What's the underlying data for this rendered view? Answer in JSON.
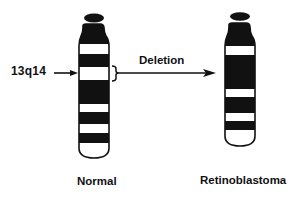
{
  "diagram": {
    "locus_label": "13q14",
    "transition_label": "Deletion",
    "left_chromosome": {
      "caption": "Normal",
      "bands": [
        {
          "type": "satellite",
          "y0": 14,
          "y1": 22
        },
        {
          "type": "dark",
          "y0": 26,
          "y1": 44
        },
        {
          "type": "light",
          "y0": 44,
          "y1": 54
        },
        {
          "type": "dark",
          "y0": 54,
          "y1": 67
        },
        {
          "type": "light",
          "y0": 67,
          "y1": 80
        },
        {
          "type": "dark",
          "y0": 80,
          "y1": 104
        },
        {
          "type": "light",
          "y0": 104,
          "y1": 112
        },
        {
          "type": "dark",
          "y0": 112,
          "y1": 124
        },
        {
          "type": "light",
          "y0": 124,
          "y1": 133
        },
        {
          "type": "dark",
          "y0": 133,
          "y1": 143
        },
        {
          "type": "light",
          "y0": 143,
          "y1": 158
        }
      ]
    },
    "right_chromosome": {
      "caption": "Retinoblastoma",
      "bands": [
        {
          "type": "satellite",
          "y0": 13,
          "y1": 20
        },
        {
          "type": "dark",
          "y0": 25,
          "y1": 46
        },
        {
          "type": "light",
          "y0": 46,
          "y1": 55
        },
        {
          "type": "dark",
          "y0": 55,
          "y1": 89
        },
        {
          "type": "light",
          "y0": 89,
          "y1": 97
        },
        {
          "type": "dark",
          "y0": 97,
          "y1": 113
        },
        {
          "type": "light",
          "y0": 113,
          "y1": 121
        },
        {
          "type": "dark",
          "y0": 121,
          "y1": 130
        },
        {
          "type": "light",
          "y0": 130,
          "y1": 146
        }
      ]
    },
    "colors": {
      "ink": "#111111",
      "background": "#ffffff"
    }
  }
}
